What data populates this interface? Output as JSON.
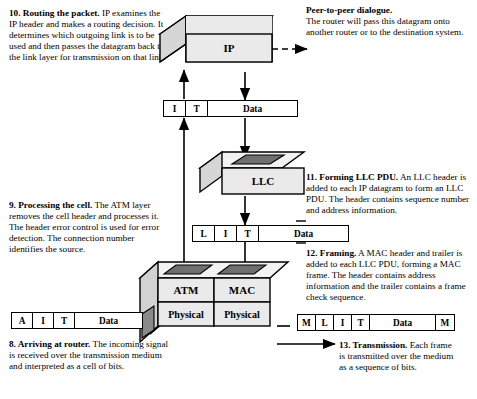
{
  "diagram": {
    "colors": {
      "face_front": "#e8e8e8",
      "face_top": "#f2f2f2",
      "face_side": "#c9c9c9",
      "slot_dark": "#6f6f6f",
      "outline": "#000000",
      "background": "#ffffff"
    },
    "boxes": [
      {
        "id": "ip",
        "label": "IP"
      },
      {
        "id": "llc",
        "label": "LLC"
      },
      {
        "id": "atm",
        "label": "ATM"
      },
      {
        "id": "mac",
        "label": "MAC"
      },
      {
        "id": "phys_left",
        "label": "Physical"
      },
      {
        "id": "phys_right",
        "label": "Physical"
      }
    ],
    "pdus": [
      {
        "id": "ip-datagram",
        "name": "IP datagram",
        "fields": [
          {
            "label": "I",
            "width": 22
          },
          {
            "label": "T",
            "width": 22
          },
          {
            "label": "Data",
            "width": 89
          }
        ]
      },
      {
        "id": "llc-pdu",
        "name": "LLC PDU",
        "fields": [
          {
            "label": "L",
            "width": 22
          },
          {
            "label": "I",
            "width": 22
          },
          {
            "label": "T",
            "width": 22
          },
          {
            "label": "Data",
            "width": 89
          }
        ]
      },
      {
        "id": "atm-cell",
        "name": "ATM cell",
        "fields": [
          {
            "label": "A",
            "width": 21
          },
          {
            "label": "I",
            "width": 21
          },
          {
            "label": "T",
            "width": 21
          },
          {
            "label": "Data",
            "width": 67
          }
        ]
      },
      {
        "id": "mac-frame",
        "name": "MAC frame",
        "fields": [
          {
            "label": "M",
            "width": 18
          },
          {
            "label": "L",
            "width": 18
          },
          {
            "label": "I",
            "width": 18
          },
          {
            "label": "T",
            "width": 18
          },
          {
            "label": "Data",
            "width": 66
          },
          {
            "label": "M",
            "width": 18
          }
        ]
      }
    ]
  },
  "annotations": {
    "step10": {
      "heading": "10. Routing the packet.",
      "body": " IP examines the IP header and makes a routing decision. It determines which outgoing link is to be used and then passes the datagram back to the link layer for transmission on that link."
    },
    "peer": {
      "heading": "Peer-to-peer dialogue.",
      "body": "The router will pass this datagram onto another router or to the destination system."
    },
    "step11": {
      "heading": "11. Forming LLC PDU.",
      "body": " An LLC header is added to each IP datagram to form an LLC PDU. The header contains sequence number and address information."
    },
    "step12": {
      "heading": "12. Framing.",
      "body": " A MAC header and trailer is added to each LLC PDU, forming a MAC frame. The header contains address information and the trailer contains a frame check sequence."
    },
    "step13": {
      "heading": "13. Transmission.",
      "body": " Each frame is transmitted over the medium as a sequence of bits."
    },
    "step9": {
      "heading": "9. Processing the cell.",
      "body": " The ATM layer removes the cell header and processes it. The header error control is used for error detection. The connection number identifies the source."
    },
    "step8": {
      "heading": "8. Arriving at router.",
      "body": " The incoming signal is received over the transmission medium and interpreted as a cell of bits."
    }
  }
}
